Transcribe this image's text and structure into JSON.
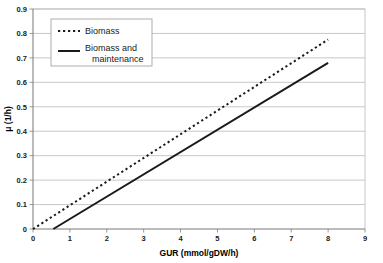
{
  "chart_data": {
    "type": "line",
    "title": "",
    "xlabel": "GUR (mmol/gDW/h)",
    "ylabel": "μ (1/h)",
    "xlim": [
      0,
      9
    ],
    "ylim": [
      0,
      0.9
    ],
    "xticks": [
      "0",
      "1",
      "2",
      "3",
      "4",
      "5",
      "6",
      "7",
      "8",
      "9"
    ],
    "yticks": [
      "0",
      "0.1",
      "0.2",
      "0.3",
      "0.4",
      "0.5",
      "0.6",
      "0.7",
      "0.8",
      "0.9"
    ],
    "grid": "horizontal",
    "legend_position": "upper-left-inside",
    "series": [
      {
        "name": "Biomass",
        "style": "dashed",
        "color": "#1a1a1a",
        "x": [
          0,
          1,
          2,
          3,
          4,
          5,
          6,
          7,
          8
        ],
        "values": [
          0.0,
          0.097,
          0.194,
          0.291,
          0.388,
          0.484,
          0.581,
          0.678,
          0.775
        ]
      },
      {
        "name": "Biomass and maintenance",
        "style": "solid",
        "color": "#1a1a1a",
        "x": [
          0.55,
          1,
          2,
          3,
          4,
          5,
          6,
          7,
          8
        ],
        "values": [
          0.0,
          0.041,
          0.132,
          0.224,
          0.315,
          0.406,
          0.498,
          0.589,
          0.68
        ]
      }
    ]
  },
  "legend": {
    "entries": [
      {
        "label": "Biomass",
        "style": "dashed"
      },
      {
        "label": "Biomass and maintenance",
        "style": "solid"
      }
    ]
  },
  "axes": {
    "x_title": "GUR (mmol/gDW/h)",
    "y_title": "μ (1/h)",
    "y_labels": {
      "t0": "0",
      "t1": "0.1",
      "t2": "0.2",
      "t3": "0.3",
      "t4": "0.4",
      "t5": "0.5",
      "t6": "0.6",
      "t7": "0.7",
      "t8": "0.8",
      "t9": "0.9"
    },
    "x_labels": {
      "t0": "0",
      "t1": "1",
      "t2": "2",
      "t3": "3",
      "t4": "4",
      "t5": "5",
      "t6": "6",
      "t7": "7",
      "t8": "8",
      "t9": "9"
    }
  }
}
